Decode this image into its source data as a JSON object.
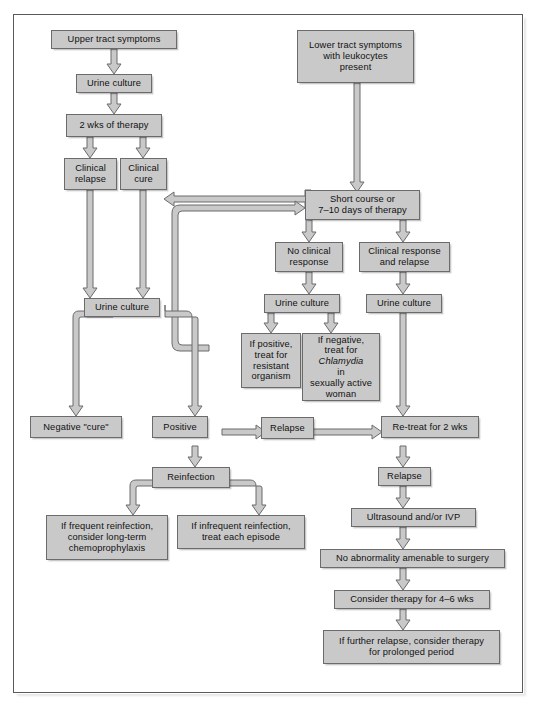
{
  "figure": {
    "box_fill": "#c9c9c9",
    "box_border": "#6b6b6b",
    "arrow_fill": "#c9c9c9",
    "arrow_stroke": "#6b6b6b",
    "frame_color": "#5a5a5a",
    "background": "#ffffff"
  },
  "nodes": {
    "upper_tract_symptoms": "Upper tract symptoms",
    "urine_culture_1": "Urine culture",
    "two_wks_therapy": "2 wks of therapy",
    "clinical_relapse": "Clinical\nrelapse",
    "clinical_cure": "Clinical\ncure",
    "lower_tract_symptoms": "Lower tract symptoms\nwith leukocytes\npresent",
    "short_course": "Short course or\n7–10 days of therapy",
    "no_clinical_response": "No clinical\nresponse",
    "clinical_response_and_relapse": "Clinical response\nand relapse",
    "urine_culture_2": "Urine culture",
    "urine_culture_3": "Urine culture",
    "urine_culture_4": "Urine culture",
    "if_positive_resistant": "If positive,\ntreat for\nresistant\norganism",
    "if_negative_chlamydia_a": "If negative,",
    "if_negative_chlamydia_b": "treat for",
    "if_negative_chlamydia_c": "Chlamydia",
    "if_negative_chlamydia_c2": " in",
    "if_negative_chlamydia_d": "sexually active",
    "if_negative_chlamydia_e": "woman",
    "negative_cure": "Negative \"cure\"",
    "positive": "Positive",
    "relapse_mid": "Relapse",
    "re_treat_2_wks": "Re-treat for 2 wks",
    "reinfection": "Reinfection",
    "if_frequent_reinfection": "If frequent reinfection,\nconsider long-term\nchemoprophylaxis",
    "if_infrequent_reinfection": "If infrequent reinfection,\ntreat each episode",
    "relapse_right": "Relapse",
    "ultrasound_ivp": "Ultrasound and/or IVP",
    "no_abnormality": "No abnormality amenable to surgery",
    "consider_therapy_4_6": "Consider therapy for 4–6 wks",
    "if_further_relapse": "If further relapse, consider therapy\nfor prolonged period"
  },
  "edges": [
    {
      "from": "upper_tract_symptoms",
      "to": "urine_culture_1"
    },
    {
      "from": "urine_culture_1",
      "to": "two_wks_therapy"
    },
    {
      "from": "two_wks_therapy",
      "to": "clinical_relapse"
    },
    {
      "from": "two_wks_therapy",
      "to": "clinical_cure"
    },
    {
      "from": "lower_tract_symptoms",
      "to": "short_course"
    },
    {
      "from": "short_course",
      "to": "clinical_cure"
    },
    {
      "from": "short_course",
      "to": "no_clinical_response"
    },
    {
      "from": "short_course",
      "to": "clinical_response_and_relapse"
    },
    {
      "from": "clinical_relapse",
      "to": "urine_culture_2"
    },
    {
      "from": "clinical_cure",
      "to": "urine_culture_2"
    },
    {
      "from": "no_clinical_response",
      "to": "urine_culture_3"
    },
    {
      "from": "clinical_response_and_relapse",
      "to": "urine_culture_4"
    },
    {
      "from": "urine_culture_3",
      "to": "if_positive_resistant"
    },
    {
      "from": "urine_culture_3",
      "to": "if_negative_chlamydia"
    },
    {
      "from": "if_positive_resistant",
      "to": "short_course"
    },
    {
      "from": "urine_culture_2",
      "to": "negative_cure"
    },
    {
      "from": "urine_culture_2",
      "to": "positive"
    },
    {
      "from": "positive",
      "to": "relapse_mid"
    },
    {
      "from": "relapse_mid",
      "to": "re_treat_2_wks"
    },
    {
      "from": "urine_culture_4",
      "to": "re_treat_2_wks"
    },
    {
      "from": "positive",
      "to": "reinfection"
    },
    {
      "from": "reinfection",
      "to": "if_frequent_reinfection"
    },
    {
      "from": "reinfection",
      "to": "if_infrequent_reinfection"
    },
    {
      "from": "re_treat_2_wks",
      "to": "relapse_right"
    },
    {
      "from": "relapse_right",
      "to": "ultrasound_ivp"
    },
    {
      "from": "ultrasound_ivp",
      "to": "no_abnormality"
    },
    {
      "from": "no_abnormality",
      "to": "consider_therapy_4_6"
    },
    {
      "from": "consider_therapy_4_6",
      "to": "if_further_relapse"
    }
  ]
}
